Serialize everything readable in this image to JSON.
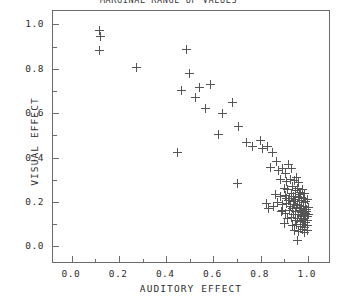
{
  "chart_data": {
    "type": "scatter",
    "title": "MARGINAL RANGE OF VALUES",
    "xlabel": "AUDITORY EFFECT",
    "ylabel": "VISUAL EFFECT",
    "xlim": [
      -0.08,
      1.09
    ],
    "ylim": [
      -0.07,
      1.06
    ],
    "xticks": [
      0.0,
      0.2,
      0.4,
      0.6,
      0.8,
      1.0
    ],
    "xticklabels": [
      "0.0",
      "0.2",
      "0.4",
      "0.6",
      "0.8",
      "1.0"
    ],
    "yticks": [
      0.0,
      0.2,
      0.4,
      0.6,
      0.8,
      1.0
    ],
    "yticklabels": [
      "0.0",
      "0.2",
      "0.4",
      "0.6",
      "0.8",
      "1.0"
    ],
    "xminorticks": [
      0.1,
      0.3,
      0.5,
      0.7,
      0.9
    ],
    "yminorticks": [
      0.1,
      0.3,
      0.5,
      0.7,
      0.9
    ],
    "grid": false,
    "legend": null,
    "marker": "plus",
    "marker_color": "#555555",
    "frame_color": "#6b6b6b",
    "background": "#ffffff",
    "points": [
      [
        0.118,
        0.972
      ],
      [
        0.12,
        0.944
      ],
      [
        0.116,
        0.882
      ],
      [
        0.272,
        0.806
      ],
      [
        0.487,
        0.886
      ],
      [
        0.497,
        0.78
      ],
      [
        0.466,
        0.7
      ],
      [
        0.541,
        0.716
      ],
      [
        0.586,
        0.73
      ],
      [
        0.447,
        0.424
      ],
      [
        0.524,
        0.672
      ],
      [
        0.566,
        0.622
      ],
      [
        0.638,
        0.598
      ],
      [
        0.683,
        0.646
      ],
      [
        0.623,
        0.504
      ],
      [
        0.707,
        0.54
      ],
      [
        0.742,
        0.47
      ],
      [
        0.766,
        0.452
      ],
      [
        0.8,
        0.476
      ],
      [
        0.808,
        0.44
      ],
      [
        0.828,
        0.452
      ],
      [
        0.852,
        0.424
      ],
      [
        0.866,
        0.382
      ],
      [
        0.7,
        0.284
      ],
      [
        0.842,
        0.356
      ],
      [
        0.876,
        0.344
      ],
      [
        0.894,
        0.352
      ],
      [
        0.906,
        0.33
      ],
      [
        0.918,
        0.368
      ],
      [
        0.93,
        0.352
      ],
      [
        0.886,
        0.3
      ],
      [
        0.908,
        0.292
      ],
      [
        0.926,
        0.3
      ],
      [
        0.944,
        0.296
      ],
      [
        0.952,
        0.312
      ],
      [
        0.962,
        0.288
      ],
      [
        0.9,
        0.262
      ],
      [
        0.916,
        0.256
      ],
      [
        0.934,
        0.268
      ],
      [
        0.948,
        0.25
      ],
      [
        0.958,
        0.262
      ],
      [
        0.968,
        0.244
      ],
      [
        0.978,
        0.256
      ],
      [
        0.988,
        0.238
      ],
      [
        0.862,
        0.232
      ],
      [
        0.884,
        0.224
      ],
      [
        0.904,
        0.23
      ],
      [
        0.922,
        0.218
      ],
      [
        0.938,
        0.226
      ],
      [
        0.95,
        0.212
      ],
      [
        0.962,
        0.222
      ],
      [
        0.972,
        0.206
      ],
      [
        0.982,
        0.216
      ],
      [
        0.992,
        0.202
      ],
      [
        1.0,
        0.212
      ],
      [
        0.826,
        0.192
      ],
      [
        0.834,
        0.172
      ],
      [
        0.87,
        0.196
      ],
      [
        0.892,
        0.188
      ],
      [
        0.91,
        0.194
      ],
      [
        0.926,
        0.182
      ],
      [
        0.94,
        0.19
      ],
      [
        0.952,
        0.176
      ],
      [
        0.964,
        0.184
      ],
      [
        0.974,
        0.17
      ],
      [
        0.984,
        0.18
      ],
      [
        0.994,
        0.166
      ],
      [
        1.002,
        0.176
      ],
      [
        0.888,
        0.158
      ],
      [
        0.906,
        0.15
      ],
      [
        0.924,
        0.16
      ],
      [
        0.938,
        0.146
      ],
      [
        0.95,
        0.156
      ],
      [
        0.962,
        0.142
      ],
      [
        0.972,
        0.152
      ],
      [
        0.982,
        0.138
      ],
      [
        0.992,
        0.148
      ],
      [
        1.0,
        0.134
      ],
      [
        0.914,
        0.124
      ],
      [
        0.932,
        0.13
      ],
      [
        0.946,
        0.116
      ],
      [
        0.958,
        0.126
      ],
      [
        0.97,
        0.112
      ],
      [
        0.98,
        0.122
      ],
      [
        0.99,
        0.108
      ],
      [
        1.0,
        0.118
      ],
      [
        0.902,
        0.104
      ],
      [
        0.936,
        0.096
      ],
      [
        0.954,
        0.1
      ],
      [
        0.968,
        0.088
      ],
      [
        0.978,
        0.098
      ],
      [
        0.988,
        0.084
      ],
      [
        0.998,
        0.094
      ],
      [
        0.944,
        0.074
      ],
      [
        0.962,
        0.068
      ],
      [
        0.976,
        0.076
      ],
      [
        0.988,
        0.062
      ],
      [
        0.998,
        0.072
      ],
      [
        0.958,
        0.028
      ],
      [
        0.892,
        0.164
      ],
      [
        0.856,
        0.18
      ],
      [
        0.944,
        0.204
      ],
      [
        0.93,
        0.24
      ],
      [
        0.966,
        0.232
      ],
      [
        0.984,
        0.196
      ],
      [
        0.974,
        0.134
      ],
      [
        0.956,
        0.188
      ],
      [
        0.936,
        0.172
      ],
      [
        0.92,
        0.206
      ],
      [
        0.908,
        0.218
      ],
      [
        0.996,
        0.158
      ],
      [
        1.004,
        0.144
      ],
      [
        0.986,
        0.124
      ],
      [
        0.97,
        0.162
      ]
    ]
  }
}
